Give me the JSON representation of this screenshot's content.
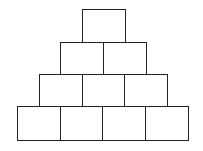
{
  "diagram": {
    "type": "block-pyramid",
    "stroke_color": "#222222",
    "fill_color": "#ffffff",
    "rows": [
      {
        "row": 1,
        "count": 1,
        "top": 9,
        "height": 33,
        "left": 82,
        "box_width": 43
      },
      {
        "row": 2,
        "count": 2,
        "top": 42,
        "height": 32,
        "left": 60,
        "box_width": 43
      },
      {
        "row": 3,
        "count": 3,
        "top": 74,
        "height": 33,
        "left": 39,
        "box_width": 43
      },
      {
        "row": 4,
        "count": 4,
        "top": 106,
        "height": 34,
        "left": 17,
        "box_width": 43
      }
    ]
  }
}
